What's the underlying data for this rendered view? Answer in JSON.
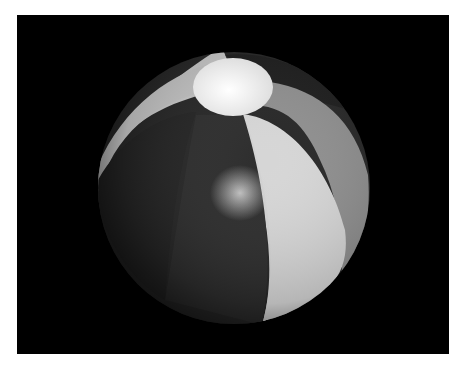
{
  "image": {
    "subject": "Rendered beach ball on black background",
    "description": "Grayscale 3D rendered beach ball with alternating light and dark panels and a bright circular cap at top",
    "colors": {
      "background": "#000000",
      "border": "#ffffff",
      "panel_light": "#d6d6d6",
      "panel_mid": "#9a9a9a",
      "panel_dark": "#2a2a2a",
      "cap": "#f2f2f2",
      "highlight": "#bfbfbf"
    }
  }
}
